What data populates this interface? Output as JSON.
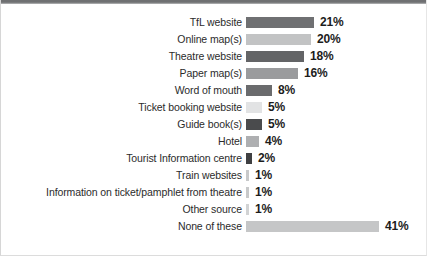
{
  "chart_data": {
    "type": "bar",
    "orientation": "horizontal",
    "title": "",
    "subtitle": "",
    "xlabel": "",
    "ylabel": "",
    "grid": false,
    "legend": "none",
    "value_suffix": "%",
    "xlim": [
      0,
      41
    ],
    "px_per_unit": 3.24,
    "categories": [
      "TfL website",
      "Online map(s)",
      "Theatre website",
      "Paper map(s)",
      "Word of mouth",
      "Ticket booking website",
      "Guide book(s)",
      "Hotel",
      "Tourist Information centre",
      "Train websites",
      "Information on ticket/pamphlet from theatre",
      "Other source",
      "None of these"
    ],
    "values": [
      21,
      20,
      18,
      16,
      8,
      5,
      5,
      4,
      2,
      1,
      1,
      1,
      41
    ],
    "value_labels": [
      "21%",
      "20%",
      "18%",
      "16%",
      "8%",
      "5%",
      "5%",
      "4%",
      "2%",
      "1%",
      "1%",
      "1%",
      "41%"
    ],
    "bar_colors": [
      "#6f7072",
      "#c2c3c4",
      "#636466",
      "#9a9b9d",
      "#6a6b6d",
      "#e2e3e4",
      "#4a4b4d",
      "#aeafb1",
      "#3f4042",
      "#c8c9ca",
      "#c8c9ca",
      "#d2d3d4",
      "#c5c6c7"
    ],
    "label_color": "#2b2b2b",
    "value_color": "#1c1c1c",
    "background_color": "#ffffff",
    "top_rule_color": "#6f7072"
  }
}
